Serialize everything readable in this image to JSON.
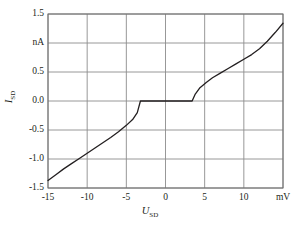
{
  "chart_data": {
    "type": "line",
    "title": "",
    "subtitle": "",
    "xlabel": "U_SD",
    "ylabel": "I_SD",
    "xlabel_symbol": "U",
    "xlabel_sub": "SD",
    "ylabel_symbol": "I",
    "ylabel_sub": "SD",
    "x_unit": "mV",
    "y_unit": "nA",
    "xlim": [
      -15,
      15
    ],
    "ylim": [
      -1.5,
      1.5
    ],
    "grid": true,
    "legend": null,
    "x_ticks": [
      -15,
      -10,
      -5,
      0,
      5,
      10,
      15
    ],
    "x_tick_labels": [
      "-15",
      "-10",
      "-5",
      "0",
      "5",
      "10",
      "mV"
    ],
    "y_ticks": [
      -1.5,
      -1.0,
      -0.5,
      0.0,
      0.5,
      1.0,
      1.5
    ],
    "y_tick_labels": [
      "-1.5",
      "-1.0",
      "-0.5",
      "0.0",
      "0.5",
      "nA",
      "1.5"
    ],
    "series": [
      {
        "name": "I_SD vs U_SD",
        "color": "#231f20",
        "x": [
          -15.0,
          -14.0,
          -13.0,
          -12.0,
          -11.0,
          -10.0,
          -9.0,
          -8.0,
          -7.0,
          -6.0,
          -5.0,
          -4.2,
          -3.6,
          -3.2,
          0.0,
          3.4,
          3.8,
          4.4,
          5.2,
          6.0,
          7.0,
          8.0,
          9.0,
          10.0,
          11.0,
          12.0,
          13.0,
          14.0,
          15.0
        ],
        "y": [
          -1.37,
          -1.27,
          -1.17,
          -1.08,
          -0.99,
          -0.9,
          -0.81,
          -0.72,
          -0.63,
          -0.53,
          -0.42,
          -0.32,
          -0.2,
          0.0,
          0.0,
          0.0,
          0.12,
          0.23,
          0.32,
          0.4,
          0.48,
          0.56,
          0.64,
          0.72,
          0.8,
          0.9,
          1.03,
          1.18,
          1.34
        ]
      }
    ],
    "annotations": [
      {
        "text": "zero-current Coulomb blockade plateau",
        "x_range": [
          -3.2,
          3.4
        ],
        "y": 0.0
      }
    ]
  },
  "style": {
    "background": "#ffffff",
    "grid_color": "#8c8c8c",
    "frame_color": "#6e6e6e",
    "curve_color": "#231f20",
    "text_color": "#231f20"
  },
  "geometry": {
    "plot_left": 48,
    "plot_right": 283,
    "plot_top": 14,
    "plot_bottom": 188
  }
}
